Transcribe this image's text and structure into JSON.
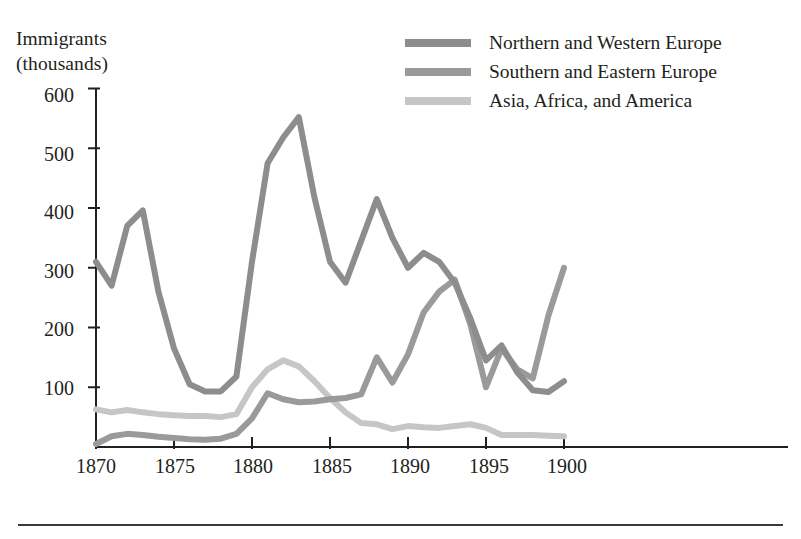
{
  "figure": {
    "axis_y_title": "Immigrants\n(thousands)",
    "axis_x_title": "Year of arrival"
  },
  "legend": {
    "position": "top-right",
    "items": [
      {
        "label": "Northern and Western Europe",
        "color": "#8d8d8d",
        "swatch": "legend-swatch-northern-western-europe"
      },
      {
        "label": "Southern and Eastern Europe",
        "color": "#9a9a9a",
        "swatch": "legend-swatch-southern-eastern-europe"
      },
      {
        "label": "Asia, Africa, and America",
        "color": "#c6c6c6",
        "swatch": "legend-swatch-asia-africa-america"
      }
    ]
  },
  "axes": {
    "y_ticks": [
      "100",
      "200",
      "300",
      "400",
      "500",
      "600"
    ],
    "x_ticks": [
      "1870",
      "1875",
      "1880",
      "1885",
      "1890",
      "1895",
      "1900"
    ]
  },
  "colors": {
    "northern_western": "#8d8d8d",
    "southern_eastern": "#9a9a9a",
    "asia_africa_america": "#c6c6c6",
    "axis": "#231f20",
    "rule": "#3a3a3a",
    "background": "#ffffff"
  },
  "chart_data": {
    "type": "line",
    "title": "",
    "subtitle": "",
    "xlabel": "Year of arrival",
    "ylabel": "Immigrants (thousands)",
    "xlim": [
      1870,
      1900
    ],
    "ylim": [
      0,
      630
    ],
    "grid": false,
    "legend_position": "top-right",
    "x": [
      1870,
      1871,
      1872,
      1873,
      1874,
      1875,
      1876,
      1877,
      1878,
      1879,
      1880,
      1881,
      1882,
      1883,
      1884,
      1885,
      1886,
      1887,
      1888,
      1889,
      1890,
      1891,
      1892,
      1893,
      1894,
      1895,
      1896,
      1897,
      1898,
      1899,
      1900
    ],
    "series": [
      {
        "name": "Northern and Western Europe",
        "color": "#8d8d8d",
        "values": [
          310,
          270,
          370,
          396,
          260,
          165,
          105,
          93,
          93,
          118,
          310,
          475,
          518,
          552,
          418,
          310,
          275,
          345,
          415,
          350,
          300,
          325,
          310,
          275,
          215,
          145,
          170,
          125,
          95,
          92,
          110
        ]
      },
      {
        "name": "Southern and Eastern Europe",
        "color": "#9a9a9a",
        "values": [
          5,
          18,
          22,
          20,
          17,
          15,
          13,
          12,
          14,
          22,
          48,
          90,
          80,
          75,
          76,
          80,
          82,
          88,
          150,
          108,
          155,
          225,
          260,
          280,
          205,
          100,
          165,
          130,
          115,
          220,
          300
        ]
      },
      {
        "name": "Asia, Africa, and America",
        "color": "#c6c6c6",
        "values": [
          63,
          58,
          62,
          58,
          55,
          53,
          52,
          52,
          50,
          55,
          100,
          130,
          145,
          135,
          110,
          82,
          58,
          40,
          38,
          30,
          35,
          33,
          32,
          35,
          38,
          32,
          20,
          20,
          20,
          19,
          18
        ]
      }
    ]
  }
}
